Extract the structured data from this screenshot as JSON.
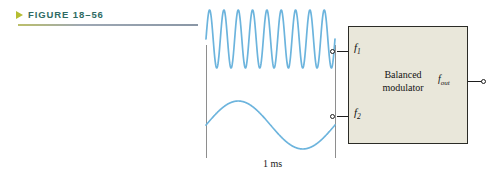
{
  "figure": {
    "marker_icon": "triangle-right-icon",
    "caption": "FIGURE 18–56",
    "accent_color": "#b5bd32",
    "caption_color": "#2f6b63"
  },
  "waveforms": {
    "carrier": {
      "name": "high-frequency-input-waveform",
      "color": "#6cb4dd",
      "cycles": 9,
      "description": "high frequency sine wave"
    },
    "modulating": {
      "name": "low-frequency-input-waveform",
      "color": "#6cb4dd",
      "cycles": 1,
      "description": "low frequency sine wave"
    }
  },
  "dimension": {
    "label": "1 ms",
    "name": "time-span-dimension"
  },
  "block_diagram": {
    "title_line_1": "Balanced",
    "title_line_2": "modulator",
    "fill_color": "#e9e7da",
    "border_color": "#2b2b26",
    "inputs": [
      {
        "symbol": "f",
        "subscript": "1"
      },
      {
        "symbol": "f",
        "subscript": "2"
      }
    ],
    "output": {
      "symbol": "f",
      "subscript": "out"
    }
  }
}
